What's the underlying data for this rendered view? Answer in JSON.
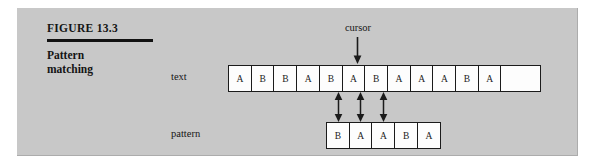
{
  "figure": {
    "number": "FIGURE 13.3",
    "title_lines": [
      "Pattern",
      "matching"
    ],
    "panel_color": "#c8c8c8",
    "rule_color": "#111111"
  },
  "labels": {
    "text_row": "text",
    "pattern_row": "pattern",
    "cursor": "cursor"
  },
  "icons": {
    "cursor_arrow": "arrow-down-icon",
    "match_arrow": "arrow-up-down-icon"
  },
  "diagram": {
    "text_cells": [
      "A",
      "B",
      "B",
      "A",
      "B",
      "A",
      "B",
      "A",
      "A",
      "A",
      "B",
      "A",
      ""
    ],
    "pattern_cells": [
      "B",
      "A",
      "A",
      "B",
      "A"
    ],
    "cursor_index": 5,
    "pattern_offset_index": 5,
    "match_arrow_count": 3,
    "match_arrow_indices": [
      0,
      1,
      2
    ]
  }
}
